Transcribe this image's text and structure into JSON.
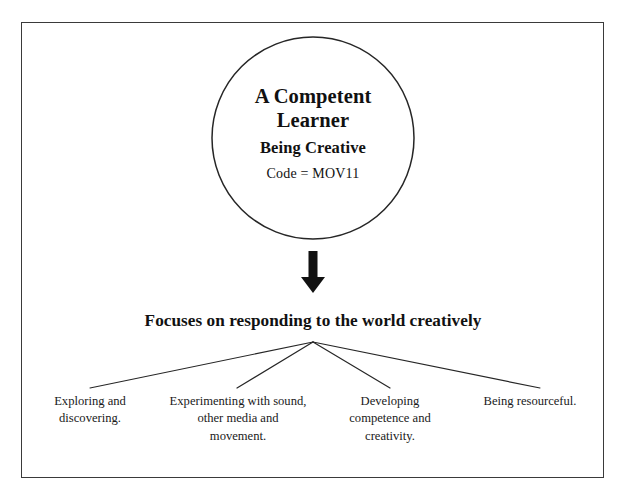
{
  "page": {
    "background": "#ffffff",
    "ink_color": "#111111",
    "frame_color": "#3a3a3a"
  },
  "circle": {
    "title_line_1": "A Competent",
    "title_line_2": "Learner",
    "subtitle": "Being Creative",
    "code": "Code = MOV11"
  },
  "arrow": {
    "direction": "down",
    "name": "down-arrow"
  },
  "focus_statement": "Focuses on responding to the world creatively",
  "leaves": [
    {
      "lines": [
        "Exploring and",
        "discovering."
      ]
    },
    {
      "lines": [
        "Experimenting with sound,",
        "other media and",
        "movement."
      ]
    },
    {
      "lines": [
        "Developing",
        "competence and",
        "creativity."
      ]
    },
    {
      "lines": [
        "Being resourceful."
      ]
    }
  ]
}
